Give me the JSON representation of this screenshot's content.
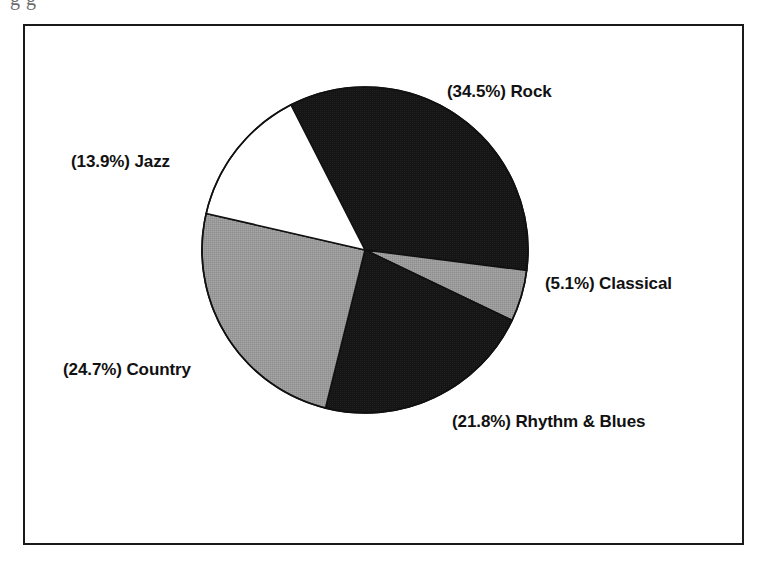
{
  "page": {
    "background_color": "#ffffff",
    "frame_color": "#1a1a1a",
    "top_caption_partial": "g              g"
  },
  "chart_data": {
    "type": "pie",
    "title": "",
    "subtitle": "",
    "xlabel": "",
    "ylabel": "",
    "legend_position": "none",
    "grid": false,
    "labels_show_percent": true,
    "label_format": "(P%) Name",
    "start_angle_deg": -27,
    "direction": "clockwise",
    "categories": [
      "Rock",
      "Classical",
      "Rhythm & Blues",
      "Country",
      "Jazz"
    ],
    "values": [
      34.5,
      5.1,
      21.8,
      24.7,
      13.9
    ],
    "units": "percent",
    "slices": [
      {
        "name": "Rock",
        "value": 34.5,
        "value_text": "34.5",
        "label": "(34.5%) Rock",
        "color": "#151515",
        "fill_style": "solid-black",
        "label_position": "upper-right"
      },
      {
        "name": "Classical",
        "value": 5.1,
        "value_text": "5.1",
        "label": "(5.1%) Classical",
        "color": "#9a9a9a",
        "fill_style": "dithered-gray",
        "label_position": "right"
      },
      {
        "name": "Rhythm & Blues",
        "value": 21.8,
        "value_text": "21.8",
        "label": "(21.8%) Rhythm & Blues",
        "color": "#151515",
        "fill_style": "solid-black",
        "label_position": "lower-right"
      },
      {
        "name": "Country",
        "value": 24.7,
        "value_text": "24.7",
        "label": "(24.7%) Country",
        "color": "#9a9a9a",
        "fill_style": "dithered-gray",
        "label_position": "lower-left"
      },
      {
        "name": "Jazz",
        "value": 13.9,
        "value_text": "13.9",
        "label": "(13.9%) Jazz",
        "color": "#ffffff",
        "fill_style": "white",
        "label_position": "upper-left"
      }
    ],
    "geometry": {
      "center_x": 365,
      "center_y": 250,
      "radius": 163,
      "stroke_color": "#111111",
      "stroke_width": 1.6
    }
  }
}
